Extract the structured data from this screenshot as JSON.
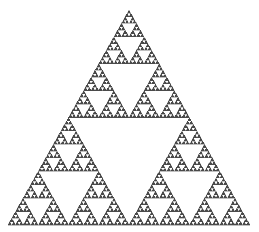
{
  "figure": {
    "name": "sierpinski-triangle",
    "background_color": "#ffffff",
    "width": 259,
    "height": 232
  },
  "chart_data": {
    "type": "scatter",
    "subtitle": "",
    "xlabel": "",
    "ylabel": "",
    "xlim": [
      0,
      259
    ],
    "ylim": [
      0,
      232
    ],
    "grid": false,
    "legend": null,
    "tick_labels": {
      "x": [],
      "y": []
    },
    "annotations": [],
    "fractal": {
      "name": "Sierpinski gasket",
      "construction": "recursive-subdivision",
      "depth": 6,
      "fill_color": "#4a4a4a",
      "stroke_color": "#4a4a4a",
      "void_color": "#ffffff",
      "orientation": "apex-up",
      "vertices": [
        {
          "label": "apex",
          "x": 129,
          "y": 10
        },
        {
          "label": "base-left",
          "x": 8,
          "y": 225
        },
        {
          "label": "base-right",
          "x": 250,
          "y": 225
        }
      ],
      "base_width": 242,
      "height_px": 215,
      "sub_triangles_at_depth": [
        1,
        3,
        9,
        27,
        81,
        243,
        729
      ],
      "holes_at_depth": [
        0,
        1,
        4,
        13,
        40,
        121,
        364
      ]
    }
  }
}
